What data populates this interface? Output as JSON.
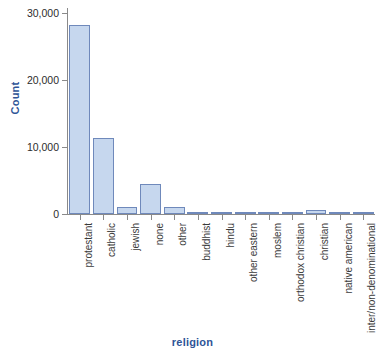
{
  "chart_data": {
    "type": "bar",
    "title": "",
    "xlabel": "religion",
    "ylabel": "Count",
    "ylim": [
      0,
      31000
    ],
    "yticks": [
      0,
      10000,
      20000,
      30000
    ],
    "ytick_labels": [
      "0",
      "10,000",
      "20,000",
      "30,000"
    ],
    "grid": false,
    "legend": null,
    "categories": [
      "protestant",
      "catholic",
      "jewish",
      "none",
      "other",
      "buddhist",
      "hindu",
      "other eastern",
      "moslem",
      "orthodox christian",
      "christian",
      "native american",
      "inter/non-denominational"
    ],
    "values": [
      28400,
      11500,
      1100,
      4500,
      1000,
      300,
      250,
      200,
      300,
      250,
      600,
      200,
      350
    ],
    "bar_fill_color": "#c6d7ee",
    "bar_border_color": "#6f89bb",
    "axis_title_color": "#2f5597",
    "axis_line_color": "#8a8a8a",
    "tick_label_color": "#2b2b2b"
  },
  "axis": {
    "x_title": "religion",
    "y_title": "Count"
  }
}
